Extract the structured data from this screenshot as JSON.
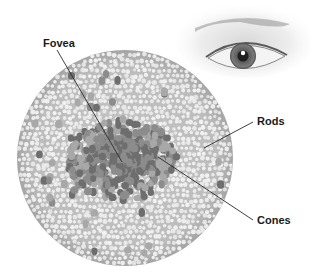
{
  "diagram": {
    "labels": [
      {
        "id": "fovea",
        "text": "Fovea",
        "x": 43,
        "y": 37,
        "line": [
          57,
          50,
          122,
          162
        ]
      },
      {
        "id": "rods",
        "text": "Rods",
        "x": 257,
        "y": 115,
        "line": [
          253,
          122,
          204,
          148
        ]
      },
      {
        "id": "cones",
        "text": "Cones",
        "x": 257,
        "y": 214,
        "line": [
          253,
          220,
          158,
          157
        ]
      }
    ],
    "retina_disc": {
      "cx": 125,
      "cy": 158,
      "r": 108
    },
    "eye_illustration": {
      "iris_cx": 243,
      "iris_cy": 56,
      "iris_r": 13
    },
    "colors": {
      "background": "#ffffff",
      "disc_fill": "#bdbdbd",
      "rod_dots": "#f2f2f2",
      "cone_dark": "#6e6e6e",
      "cone_mid": "#8c8c8c",
      "cone_light": "#a8a8a8",
      "leader_line": "#2a2a2a",
      "label_text": "#1a1a1a"
    }
  }
}
